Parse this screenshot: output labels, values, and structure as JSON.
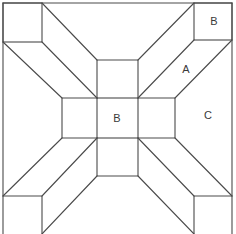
{
  "diagram": {
    "type": "quilt-block-pattern",
    "stroke_color": "#4a4a4a",
    "background": "#ffffff",
    "labels": [
      {
        "id": "corner-b",
        "text": "B",
        "x": 214,
        "y": 21
      },
      {
        "id": "diagonal-a",
        "text": "A",
        "x": 186,
        "y": 69
      },
      {
        "id": "center-b",
        "text": "B",
        "x": 117,
        "y": 118
      },
      {
        "id": "side-c",
        "text": "C",
        "x": 208,
        "y": 115
      }
    ]
  }
}
